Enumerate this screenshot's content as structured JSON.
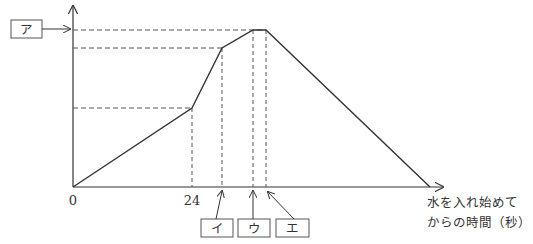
{
  "diagram": {
    "type": "line-graph",
    "x_axis_label_line1": "水を入れ始めて",
    "x_axis_label_line2": "からの時間（秒）",
    "origin_label": "0",
    "tick_label_24": "24",
    "y_marker_label": "ア",
    "x_markers": [
      {
        "label": "イ"
      },
      {
        "label": "ウ"
      },
      {
        "label": "エ"
      }
    ],
    "points": [
      {
        "x": 0,
        "y": 0
      },
      {
        "x": 24,
        "y": "level-1"
      },
      {
        "x": "イ",
        "y": "level-2"
      },
      {
        "x": "ウ",
        "y": "ア"
      },
      {
        "x": "エ",
        "y": "ア"
      },
      {
        "x": "end",
        "y": 0
      }
    ],
    "colors": {
      "line": "#333333",
      "dash": "#555555"
    }
  }
}
